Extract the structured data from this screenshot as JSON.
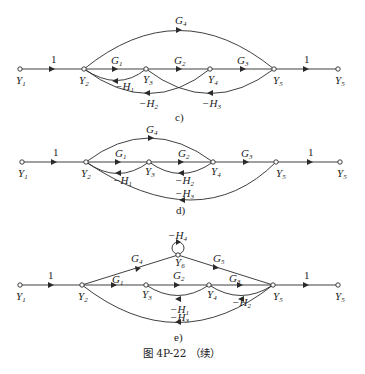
{
  "figure": {
    "caption": "图 4P-22 （续）"
  },
  "diagrams": [
    {
      "id": "c",
      "label": "c)",
      "nodes": [
        "Y1",
        "Y2",
        "Y3",
        "Y4",
        "Y5",
        "Y5"
      ],
      "branches": [
        {
          "from": "Y1",
          "to": "Y2",
          "gain": "1"
        },
        {
          "from": "Y2",
          "to": "Y3",
          "gain": "G1"
        },
        {
          "from": "Y3",
          "to": "Y4",
          "gain": "G2"
        },
        {
          "from": "Y4",
          "to": "Y5",
          "gain": "G3"
        },
        {
          "from": "Y5",
          "to": "Y5 (out)",
          "gain": "1"
        },
        {
          "from": "Y2",
          "to": "Y5",
          "gain": "G4"
        },
        {
          "from": "Y3",
          "to": "Y2",
          "gain": "-H1"
        },
        {
          "from": "Y4",
          "to": "Y2",
          "gain": "-H2"
        },
        {
          "from": "Y5",
          "to": "Y3",
          "gain": "-H3"
        }
      ]
    },
    {
      "id": "d",
      "label": "d)",
      "nodes": [
        "Y1",
        "Y2",
        "Y3",
        "Y4",
        "Y5",
        "Y5"
      ],
      "branches": [
        {
          "from": "Y1",
          "to": "Y2",
          "gain": "1"
        },
        {
          "from": "Y2",
          "to": "Y3",
          "gain": "G1"
        },
        {
          "from": "Y3",
          "to": "Y4",
          "gain": "G2"
        },
        {
          "from": "Y4",
          "to": "Y5",
          "gain": "G3"
        },
        {
          "from": "Y5",
          "to": "Y5 (out)",
          "gain": "1"
        },
        {
          "from": "Y2",
          "to": "Y4",
          "gain": "G4"
        },
        {
          "from": "Y3",
          "to": "Y2",
          "gain": "-H1"
        },
        {
          "from": "Y4",
          "to": "Y3",
          "gain": "-H2"
        },
        {
          "from": "Y5",
          "to": "Y2",
          "gain": "-H3"
        }
      ]
    },
    {
      "id": "e",
      "label": "e)",
      "nodes": [
        "Y1",
        "Y2",
        "Y3",
        "Y4",
        "Y5",
        "Y5",
        "Y6"
      ],
      "branches": [
        {
          "from": "Y1",
          "to": "Y2",
          "gain": "1"
        },
        {
          "from": "Y2",
          "to": "Y3",
          "gain": "G1"
        },
        {
          "from": "Y3",
          "to": "Y4",
          "gain": "G2"
        },
        {
          "from": "Y4",
          "to": "Y5",
          "gain": "G3"
        },
        {
          "from": "Y5",
          "to": "Y5 (out)",
          "gain": "1"
        },
        {
          "from": "Y2",
          "to": "Y6",
          "gain": "G4"
        },
        {
          "from": "Y6",
          "to": "Y5",
          "gain": "G5"
        },
        {
          "from": "Y6",
          "to": "Y6",
          "gain": "-H4"
        },
        {
          "from": "Y4",
          "to": "Y3",
          "gain": "-H1"
        },
        {
          "from": "Y5",
          "to": "Y4",
          "gain": "-H2"
        },
        {
          "from": "Y5",
          "to": "Y2",
          "gain": "-H3"
        }
      ]
    }
  ],
  "text": {
    "one": "1",
    "Y": "Y",
    "G": "G",
    "H": "H",
    "minusH": "−H",
    "s1": "1",
    "s2": "2",
    "s3": "3",
    "s4": "4",
    "s5": "5",
    "s6": "6",
    "cap_c": "c)",
    "cap_d": "d)",
    "cap_e": "e)"
  }
}
